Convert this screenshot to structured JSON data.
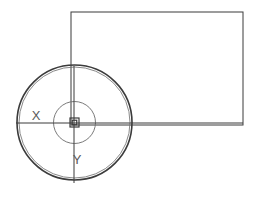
{
  "canvas": {
    "width": 253,
    "height": 197,
    "background_color": "#ffffff",
    "stroke_color": "#3b3b3b",
    "light_stroke_color": "#6b6b6b",
    "label_color": "#5a5a5a"
  },
  "drawing": {
    "title": "cad-wireframe-circle-and-rectangle",
    "entities": [
      {
        "name": "outer-circle",
        "type": "circle",
        "cx": 74.5,
        "cy": 122.5,
        "r": 57.5,
        "stroke_width": 1.6,
        "selected": true
      },
      {
        "name": "outer-circle-highlight",
        "type": "circle",
        "cx": 74.5,
        "cy": 122.5,
        "r": 55.5,
        "stroke_width": 0.8,
        "selected": false
      },
      {
        "name": "inner-circle",
        "type": "circle",
        "cx": 74.5,
        "cy": 122.5,
        "r": 21,
        "stroke_width": 0.9,
        "selected": false
      },
      {
        "name": "rectangle",
        "type": "rect",
        "x": 71,
        "y": 12,
        "width": 172,
        "height": 113,
        "stroke_width": 1.0
      },
      {
        "name": "horizontal-axis",
        "type": "line",
        "x1": 16,
        "y1": 123,
        "x2": 243,
        "y2": 123,
        "stroke_width": 1.0
      },
      {
        "name": "vertical-axis",
        "type": "line",
        "x1": 74,
        "y1": 66,
        "x2": 74,
        "y2": 183,
        "stroke_width": 1.0
      }
    ],
    "center_marker": {
      "name": "center-grip-square",
      "cx": 74.5,
      "cy": 122.5,
      "outer_size": 9,
      "inner_size": 4.5,
      "stroke_width": 1.2
    },
    "labels": [
      {
        "name": "x-axis-label",
        "text": "X",
        "x": 36,
        "y": 120
      },
      {
        "name": "y-axis-label",
        "text": "Y",
        "x": 77,
        "y": 164
      }
    ]
  }
}
